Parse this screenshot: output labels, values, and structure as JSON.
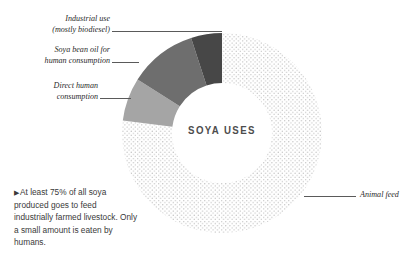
{
  "center": {
    "title": "SOYA USES"
  },
  "note": {
    "bullet": "▶",
    "text": "At least 75% of all soya produced goes to feed industrially farmed livestock. Only a small amount is eaten by humans."
  },
  "callouts": [
    {
      "id": "industrial-use",
      "line1": "Industrial use",
      "line2": "(mostly biodiesel)"
    },
    {
      "id": "soya-bean-oil",
      "line1": "Soya bean oil for",
      "line2": "human consumption"
    },
    {
      "id": "direct-human",
      "line1": "Direct human",
      "line2": "consumption"
    },
    {
      "id": "animal-feed",
      "line1": "Animal feed",
      "line2": ""
    }
  ],
  "colors": {
    "animal_feed": "#ffffff",
    "animal_feed_dots": "#b9b9b9",
    "direct_human": "#a5a5a5",
    "soya_bean_oil": "#6e6e6e",
    "industrial_use": "#474747",
    "leader_line": "#5a5a5a",
    "text": "#2b2b2b",
    "background": "#ffffff"
  },
  "chart_data": {
    "type": "pie",
    "title": "SOYA USES",
    "subtitle": "",
    "xlabel": "",
    "ylabel": "",
    "donut": true,
    "inner_radius_ratio": 0.5,
    "start_angle_deg": 0,
    "direction": "clockwise",
    "legend_position": "callout-labels",
    "grid": false,
    "categories": [
      "Animal feed",
      "Direct human consumption",
      "Soya bean oil for human consumption",
      "Industrial use (mostly biodiesel)"
    ],
    "values": [
      77,
      7,
      11,
      5
    ],
    "unit": "percent",
    "slices": [
      {
        "label": "Animal feed",
        "value": 77,
        "start_deg": 0,
        "end_deg": 277.2,
        "fill": "#ffffff",
        "pattern": "dots",
        "pattern_color": "#b9b9b9"
      },
      {
        "label": "Direct human consumption",
        "value": 7,
        "start_deg": 277.2,
        "end_deg": 302.4,
        "fill": "#a5a5a5",
        "pattern": "solid",
        "pattern_color": ""
      },
      {
        "label": "Soya bean oil for human consumption",
        "value": 11,
        "start_deg": 302.4,
        "end_deg": 342.0,
        "fill": "#6e6e6e",
        "pattern": "solid",
        "pattern_color": ""
      },
      {
        "label": "Industrial use (mostly biodiesel)",
        "value": 5,
        "start_deg": 342.0,
        "end_deg": 360.0,
        "fill": "#474747",
        "pattern": "solid",
        "pattern_color": ""
      }
    ],
    "annotations": [
      "At least 75% of all soya produced goes to feed industrially farmed livestock. Only a small amount is eaten by humans."
    ]
  }
}
